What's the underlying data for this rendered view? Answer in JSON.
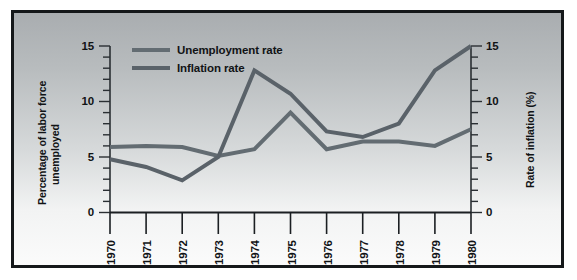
{
  "figure": {
    "background_top_color": "#a9adb0",
    "background_bottom_color": "#fbfbfb",
    "border_color": "#15181a"
  },
  "legend": {
    "position": "top-left-inside",
    "entries": [
      {
        "label": "Unemployment rate",
        "color": "#636c72",
        "icon": "line-swatch-icon"
      },
      {
        "label": "Inflation rate",
        "color": "#5a6269",
        "icon": "line-swatch-icon"
      }
    ]
  },
  "axes": {
    "left": {
      "title_line1": "Percentage of labor force",
      "title_line2": "unemployed",
      "ticks": [
        "0",
        "5",
        "10",
        "15"
      ],
      "min": 0,
      "max": 15,
      "minor_tick_step": 1
    },
    "right": {
      "title": "Rate of inflation (%)",
      "ticks": [
        "0",
        "5",
        "10",
        "15"
      ],
      "min": 0,
      "max": 15,
      "minor_tick_step": 1
    },
    "bottom": {
      "ticks": [
        "1970",
        "1971",
        "1972",
        "1973",
        "1974",
        "1975",
        "1976",
        "1977",
        "1978",
        "1979",
        "1980"
      ]
    }
  },
  "chart_data": {
    "type": "line",
    "title": "",
    "subtitle": "",
    "xlabel": "",
    "ylabel": "Percentage of labor force unemployed",
    "y2label": "Rate of inflation (%)",
    "grid": false,
    "legend_position": "top-left",
    "x": [
      "1970",
      "1971",
      "1972",
      "1973",
      "1974",
      "1975",
      "1976",
      "1977",
      "1978",
      "1979",
      "1980"
    ],
    "xlim": [
      1970,
      1980
    ],
    "ylim": [
      0,
      15
    ],
    "y2lim": [
      0,
      15
    ],
    "series": [
      {
        "name": "Unemployment rate",
        "axis": "left",
        "color": "#636c72",
        "values": [
          5.9,
          6.0,
          5.9,
          5.1,
          5.7,
          9.0,
          5.7,
          6.4,
          6.4,
          6.0,
          7.5
        ]
      },
      {
        "name": "Inflation rate",
        "axis": "right",
        "color": "#5a6269",
        "values": [
          4.8,
          4.1,
          2.9,
          5.0,
          12.8,
          10.7,
          7.3,
          6.8,
          8.0,
          12.8,
          15.0
        ]
      }
    ]
  }
}
